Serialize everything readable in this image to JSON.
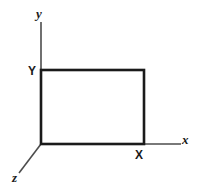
{
  "figure": {
    "name": "3d-coordinate-axes-with-rectangle",
    "background_color": "#ffffff",
    "width": 199,
    "height": 190,
    "labels": {
      "y_axis": "y",
      "x_axis": "x",
      "z_axis": "z",
      "Y_vertex": "Y",
      "X_vertex": "X"
    },
    "colors": {
      "axis_line": "#4d4d4d",
      "rectangle_stroke": "#1a1a1a",
      "label_text": "#1a1a1a"
    },
    "geometry": {
      "origin": {
        "x": 41,
        "y": 144
      },
      "y_axis_top": {
        "x": 41,
        "y": 22
      },
      "x_axis_right": {
        "x": 181,
        "y": 144
      },
      "z_axis_end": {
        "x": 19,
        "y": 173
      },
      "rectangle": {
        "left": 41,
        "top": 70,
        "right": 144,
        "bottom": 144
      },
      "axis_stroke_width": 1.6,
      "rectangle_stroke_width": 2.6
    }
  }
}
